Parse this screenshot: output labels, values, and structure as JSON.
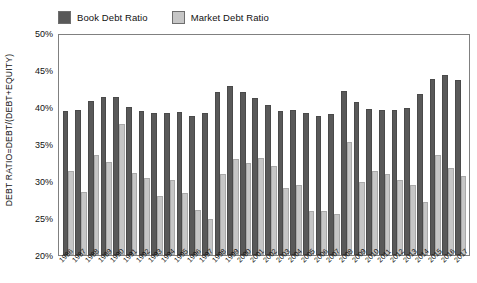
{
  "legend": {
    "position": "top",
    "entries": [
      {
        "label": "Book Debt Ratio",
        "color": "#595959",
        "key": "book"
      },
      {
        "label": "Market Debt Ratio",
        "color": "#c6c6c6",
        "key": "market"
      }
    ]
  },
  "axes": {
    "ylabel": "DEBT RATIO=DEBT/(DEBT+EQUITY)",
    "xlabel": "",
    "y_ticks": [
      "20%",
      "25%",
      "30%",
      "35%",
      "40%",
      "45%",
      "50%"
    ],
    "y_tick_values": [
      20,
      25,
      30,
      35,
      40,
      45,
      50
    ],
    "ymin": 20,
    "ymax": 50
  },
  "chart_data": {
    "type": "bar",
    "title": "",
    "subtitle": "",
    "xlabel": "",
    "ylabel": "DEBT RATIO=DEBT/(DEBT+EQUITY)",
    "ylim": [
      20,
      50
    ],
    "grid": false,
    "legend_position": "top",
    "categories": [
      "1986",
      "1987",
      "1988",
      "1989",
      "1990",
      "1991",
      "1992",
      "1993",
      "1994",
      "1995",
      "1996",
      "1997",
      "1998",
      "1999",
      "2000",
      "2001",
      "2002",
      "2003",
      "2004",
      "2005",
      "2006",
      "2007",
      "2008",
      "2009",
      "2010",
      "2011",
      "2012",
      "2013",
      "2014",
      "2015",
      "2016",
      "2017"
    ],
    "series": [
      {
        "name": "Book Debt Ratio",
        "color": "#595959",
        "values": [
          39.6,
          39.8,
          41.0,
          41.6,
          41.6,
          40.2,
          39.6,
          39.4,
          39.4,
          39.5,
          39.0,
          39.3,
          42.2,
          43.0,
          42.2,
          41.4,
          40.4,
          39.7,
          39.8,
          39.4,
          38.9,
          39.2,
          42.3,
          40.8,
          39.9,
          39.8,
          39.8,
          40.0,
          41.9,
          44.0,
          44.6,
          43.8
        ]
      },
      {
        "name": "Market Debt Ratio",
        "color": "#c6c6c6",
        "values": [
          31.5,
          28.6,
          33.7,
          32.7,
          37.8,
          31.2,
          30.5,
          28.0,
          30.2,
          28.4,
          26.2,
          24.9,
          31.1,
          33.1,
          32.6,
          33.2,
          32.2,
          29.1,
          29.5,
          26.0,
          26.0,
          25.6,
          35.4,
          30.0,
          31.5,
          31.0,
          30.2,
          29.6,
          27.2,
          33.7,
          31.8,
          30.8
        ]
      }
    ]
  }
}
